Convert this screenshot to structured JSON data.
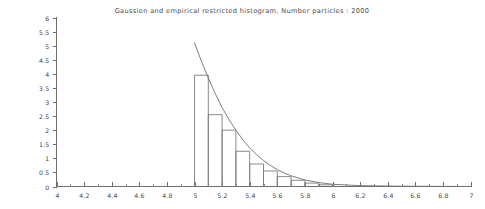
{
  "chart_data": {
    "type": "bar",
    "title": "Gaussien and empirical restricted histogram, Number particles : 2000",
    "xlabel": "",
    "ylabel": "",
    "xlim": [
      4,
      7
    ],
    "ylim": [
      0,
      6
    ],
    "grid": false,
    "legend": "none",
    "x_ticks": [
      "4",
      "4.2",
      "4.4",
      "4.6",
      "4.8",
      "5",
      "5.2",
      "5.4",
      "5.6",
      "5.8",
      "6",
      "6.2",
      "6.4",
      "6.6",
      "6.8",
      "7"
    ],
    "x_tick_values": [
      4,
      4.2,
      4.4,
      4.6,
      4.8,
      5,
      5.2,
      5.4,
      5.6,
      5.8,
      6,
      6.2,
      6.4,
      6.6,
      6.8,
      7
    ],
    "y_ticks": [
      "0",
      "0.5",
      "1",
      "1.5",
      "2",
      "2.5",
      "3",
      "3.5",
      "4",
      "4.5",
      "5",
      "5.5",
      "6"
    ],
    "y_tick_values": [
      0,
      0.5,
      1,
      1.5,
      2,
      2.5,
      3,
      3.5,
      4,
      4.5,
      5,
      5.5,
      6
    ],
    "bar_width": 0.1,
    "bin_edges": [
      5.0,
      5.1,
      5.2,
      5.3,
      5.4,
      5.5,
      5.6,
      5.7,
      5.8,
      5.9,
      6.0
    ],
    "categories": [
      "5.0",
      "5.1",
      "5.2",
      "5.3",
      "5.4",
      "5.5",
      "5.6",
      "5.7",
      "5.8",
      "5.9"
    ],
    "values": [
      3.95,
      2.55,
      2.0,
      1.25,
      0.8,
      0.55,
      0.35,
      0.22,
      0.12,
      0.06
    ],
    "series": [
      {
        "name": "empirical restricted histogram",
        "type": "bar",
        "values": [
          3.95,
          2.55,
          2.0,
          1.25,
          0.8,
          0.55,
          0.35,
          0.22,
          0.12,
          0.06
        ]
      },
      {
        "name": "Gaussien density",
        "type": "line",
        "x": [
          5.0,
          5.05,
          5.1,
          5.15,
          5.2,
          5.25,
          5.3,
          5.35,
          5.4,
          5.45,
          5.5,
          5.55,
          5.6,
          5.65,
          5.7,
          5.8,
          5.9,
          6.0,
          6.2,
          6.5,
          7.0
        ],
        "values": [
          5.1,
          4.45,
          3.85,
          3.3,
          2.8,
          2.38,
          2.0,
          1.66,
          1.37,
          1.13,
          0.92,
          0.75,
          0.6,
          0.48,
          0.38,
          0.23,
          0.14,
          0.08,
          0.03,
          0.01,
          0.0
        ]
      }
    ],
    "number_particles": "2000"
  },
  "figure": {
    "background_color": "#ffffff",
    "line_color": "#7d7d7d",
    "text_color": "#3f3f3f"
  }
}
